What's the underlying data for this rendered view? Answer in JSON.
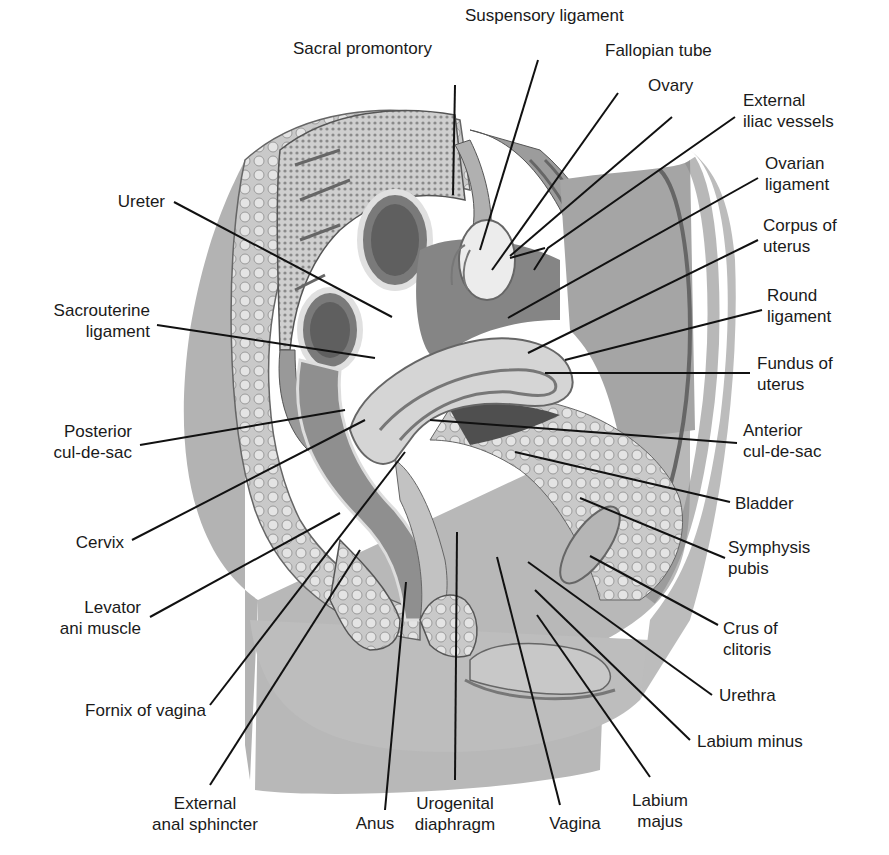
{
  "figure": {
    "colors": {
      "background": "#ffffff",
      "line": "#111111",
      "tissue_dark": "#6e6e6e",
      "tissue_mid": "#a8a8a8",
      "tissue_light": "#d6d6d6",
      "text": "#1a1a1a"
    }
  },
  "labels": {
    "suspensory_ligament": {
      "line1": "Suspensory ligament"
    },
    "sacral_promontory": {
      "line1": "Sacral promontory"
    },
    "fallopian_tube": {
      "line1": "Fallopian tube"
    },
    "ovary": {
      "line1": "Ovary"
    },
    "external_iliac_vessels": {
      "line1": "External",
      "line2": "iliac vessels"
    },
    "ovarian_ligament": {
      "line1": "Ovarian",
      "line2": "ligament"
    },
    "corpus_of_uterus": {
      "line1": "Corpus of",
      "line2": "uterus"
    },
    "round_ligament": {
      "line1": "Round",
      "line2": "ligament"
    },
    "fundus_of_uterus": {
      "line1": "Fundus of",
      "line2": "uterus"
    },
    "anterior_cul_de_sac": {
      "line1": "Anterior",
      "line2": "cul-de-sac"
    },
    "bladder": {
      "line1": "Bladder"
    },
    "symphysis_pubis": {
      "line1": "Symphysis",
      "line2": "pubis"
    },
    "crus_of_clitoris": {
      "line1": "Crus of",
      "line2": "clitoris"
    },
    "urethra": {
      "line1": "Urethra"
    },
    "labium_minus": {
      "line1": "Labium minus"
    },
    "labium_majus": {
      "line1": "Labium",
      "line2": "majus"
    },
    "vagina": {
      "line1": "Vagina"
    },
    "urogenital_diaphragm": {
      "line1": "Urogenital",
      "line2": "diaphragm"
    },
    "anus": {
      "line1": "Anus"
    },
    "external_anal_sphincter": {
      "line1": "External",
      "line2": "anal sphincter"
    },
    "fornix_of_vagina": {
      "line1": "Fornix of vagina"
    },
    "levator_ani_muscle": {
      "line1": "Levator",
      "line2": "ani muscle"
    },
    "cervix": {
      "line1": "Cervix"
    },
    "posterior_cul_de_sac": {
      "line1": "Posterior",
      "line2": "cul-de-sac"
    },
    "sacrouterine_ligament": {
      "line1": "Sacrouterine",
      "line2": "ligament"
    },
    "ureter": {
      "line1": "Ureter"
    }
  }
}
